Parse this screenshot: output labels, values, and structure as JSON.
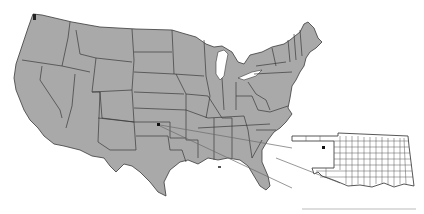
{
  "map": {
    "title": "",
    "subject": "Contiguous United States with Oklahoma county inset",
    "colors": {
      "land_fill": "#a9a9a9",
      "border": "#3a3a3a",
      "inset_fill": "#ffffff",
      "inset_border": "#444444",
      "marker": "#111111",
      "leader_line": "#6a6a6a",
      "background": "#ffffff"
    },
    "marker": {
      "label": "",
      "state": "Oklahoma",
      "region": "western Oklahoma",
      "main_map_xy": [
        158,
        124
      ],
      "inset_xy": [
        323,
        147
      ]
    },
    "inset": {
      "state": "Oklahoma",
      "shows": "county boundaries",
      "bbox": [
        292,
        132,
        418,
        193
      ]
    },
    "footer_rule": {
      "x1": 302,
      "x2": 416,
      "y": 209
    }
  }
}
